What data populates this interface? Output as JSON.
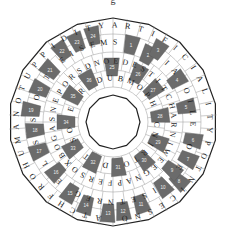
{
  "puzzle": {
    "title_fragment": "g",
    "center": [
      113,
      122
    ],
    "outer_radius": 104,
    "inner_radius": 27,
    "colors": {
      "dark_cell": "#6b6b6b",
      "light_cell": "#ffffff",
      "line": "#999999",
      "border": "#222222"
    },
    "rings": [
      {
        "r": 97,
        "letters": [
          "Y",
          "A",
          "R",
          "T",
          "I",
          "F",
          "I",
          "C",
          "I",
          "A",
          "L",
          "I",
          "T",
          "Y",
          "P",
          "O",
          "T",
          "N",
          "I",
          "C",
          "E",
          "S",
          "N",
          "O",
          "M",
          "A",
          "T",
          "C",
          "H",
          "F",
          "R",
          "O",
          "H",
          "U",
          "M",
          "A",
          "N",
          "O",
          "T",
          "U",
          "P",
          "P",
          "I",
          "D",
          "I",
          "T"
        ]
      },
      {
        "r": 80,
        "letters": [
          "M",
          "S",
          "E",
          "E",
          "L",
          "C",
          "I",
          "A",
          "P",
          "O",
          "I",
          "L",
          "E",
          "R",
          "O",
          "L",
          "E",
          "G",
          "H",
          "I",
          "S",
          "E",
          "T",
          "N",
          "R",
          "E",
          "G",
          "H",
          "E",
          "F",
          "L",
          "O",
          "S",
          "E",
          "S",
          "I",
          "O",
          "S",
          "T",
          "P",
          "E",
          "I",
          "S",
          "E"
        ]
      },
      {
        "r": 61,
        "letters": [
          "O",
          "E",
          "D",
          "E",
          "S",
          "T",
          "I",
          "T",
          "C",
          "H",
          "A",
          "R",
          "N",
          "I",
          "W",
          "E",
          "E",
          "G",
          "N",
          "A",
          "P",
          "F",
          "E",
          "R",
          "S",
          "O",
          "X",
          "B",
          "O",
          "G",
          "A",
          "S",
          "N",
          "E",
          "P",
          "O",
          "R",
          "S",
          "D",
          "N"
        ]
      },
      {
        "r": 44,
        "letters": [
          "U",
          "B",
          "M",
          "O",
          "P",
          "H",
          "A",
          "C",
          "N",
          "I",
          "R",
          "T",
          "O",
          "A",
          "D",
          "E",
          "T",
          "D",
          "S",
          "O",
          "H",
          "E",
          "M",
          "R",
          "A",
          "D"
        ]
      }
    ],
    "numbered_cells": [
      {
        "n": "1",
        "x": 131,
        "y": 45
      },
      {
        "n": "2",
        "x": 148,
        "y": 55
      },
      {
        "n": "3",
        "x": 158,
        "y": 50
      },
      {
        "n": "4",
        "x": 177,
        "y": 80
      },
      {
        "n": "5",
        "x": 186,
        "y": 107
      },
      {
        "n": "6",
        "x": 193,
        "y": 140
      },
      {
        "n": "7",
        "x": 188,
        "y": 159
      },
      {
        "n": "8",
        "x": 179,
        "y": 181
      },
      {
        "n": "9",
        "x": 172,
        "y": 170
      },
      {
        "n": "10",
        "x": 163,
        "y": 187
      },
      {
        "n": "11",
        "x": 141,
        "y": 204
      },
      {
        "n": "12",
        "x": 123,
        "y": 211
      },
      {
        "n": "13",
        "x": 108,
        "y": 213
      },
      {
        "n": "14",
        "x": 86,
        "y": 205
      },
      {
        "n": "15",
        "x": 70,
        "y": 193
      },
      {
        "n": "16",
        "x": 56,
        "y": 172
      },
      {
        "n": "17",
        "x": 39,
        "y": 151
      },
      {
        "n": "18",
        "x": 35,
        "y": 130
      },
      {
        "n": "19",
        "x": 31,
        "y": 110
      },
      {
        "n": "20",
        "x": 40,
        "y": 89
      },
      {
        "n": "21",
        "x": 50,
        "y": 70
      },
      {
        "n": "22",
        "x": 62,
        "y": 51
      },
      {
        "n": "23",
        "x": 77,
        "y": 42
      },
      {
        "n": "24",
        "x": 93,
        "y": 36
      },
      {
        "n": "25",
        "x": 112,
        "y": 67
      },
      {
        "n": "26",
        "x": 138,
        "y": 74
      },
      {
        "n": "27",
        "x": 153,
        "y": 90
      },
      {
        "n": "28",
        "x": 160,
        "y": 116
      },
      {
        "n": "29",
        "x": 158,
        "y": 142
      },
      {
        "n": "30",
        "x": 144,
        "y": 160
      },
      {
        "n": "31",
        "x": 118,
        "y": 167
      },
      {
        "n": "32",
        "x": 93,
        "y": 162
      },
      {
        "n": "33",
        "x": 73,
        "y": 148
      },
      {
        "n": "34",
        "x": 66,
        "y": 122
      },
      {
        "n": "35",
        "x": 73,
        "y": 96
      },
      {
        "n": "36",
        "x": 89,
        "y": 80
      }
    ]
  }
}
